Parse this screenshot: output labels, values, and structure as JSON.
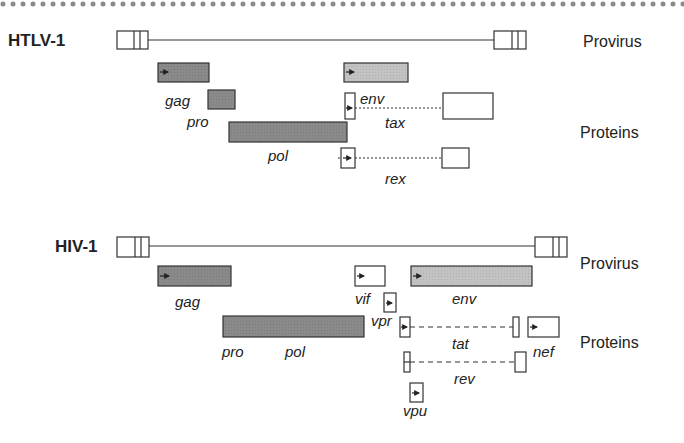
{
  "colors": {
    "outline": "#333333",
    "dark_protein": "#8a8a8a",
    "light_protein": "#bdbdbd",
    "dots": "#8a8a8a",
    "background": "#ffffff"
  },
  "border": {
    "style": "dotted",
    "y": 4
  },
  "panels": [
    {
      "id": "htlv1",
      "virus_label": "HTLV-1",
      "provirus_label": "Provirus",
      "proteins_label": "Proteins",
      "genes": [
        {
          "name": "gag",
          "fill": "dark"
        },
        {
          "name": "pro",
          "fill": "dark"
        },
        {
          "name": "pol",
          "fill": "dark"
        },
        {
          "name": "env",
          "fill": "light"
        },
        {
          "name": "tax",
          "fill": "none",
          "spliced": true
        },
        {
          "name": "rex",
          "fill": "none",
          "spliced": true
        }
      ]
    },
    {
      "id": "hiv1",
      "virus_label": "HIV-1",
      "provirus_label": "Provirus",
      "proteins_label": "Proteins",
      "genes": [
        {
          "name": "gag",
          "fill": "dark"
        },
        {
          "name": "pro",
          "fill": "dark"
        },
        {
          "name": "pol",
          "fill": "dark"
        },
        {
          "name": "vif",
          "fill": "none"
        },
        {
          "name": "vpr",
          "fill": "none"
        },
        {
          "name": "env",
          "fill": "light"
        },
        {
          "name": "tat",
          "fill": "none",
          "spliced": true
        },
        {
          "name": "nef",
          "fill": "none"
        },
        {
          "name": "rev",
          "fill": "none",
          "spliced": true
        },
        {
          "name": "vpu",
          "fill": "none"
        }
      ]
    }
  ]
}
